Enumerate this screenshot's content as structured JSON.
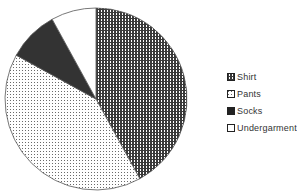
{
  "chart_data": {
    "type": "pie",
    "title": "",
    "categories": [
      "Shirt",
      "Pants",
      "Socks",
      "Undergarments"
    ],
    "values": [
      42,
      41,
      9,
      8
    ],
    "units": "percent (estimated)",
    "start_angle_deg": 0,
    "direction": "clockwise",
    "legend_position": "right",
    "fills": {
      "Shirt": "dense checker pattern (dark)",
      "Pants": "light dotted pattern",
      "Socks": "solid dark #333333",
      "Undergarments": "white #ffffff"
    }
  },
  "legend": {
    "items": [
      {
        "label": "Shirt",
        "icon": "checker-swatch"
      },
      {
        "label": "Pants",
        "icon": "dotted-swatch"
      },
      {
        "label": "Socks",
        "icon": "solid-dark-swatch"
      },
      {
        "label": "Undergarments",
        "icon": "white-swatch"
      }
    ]
  }
}
